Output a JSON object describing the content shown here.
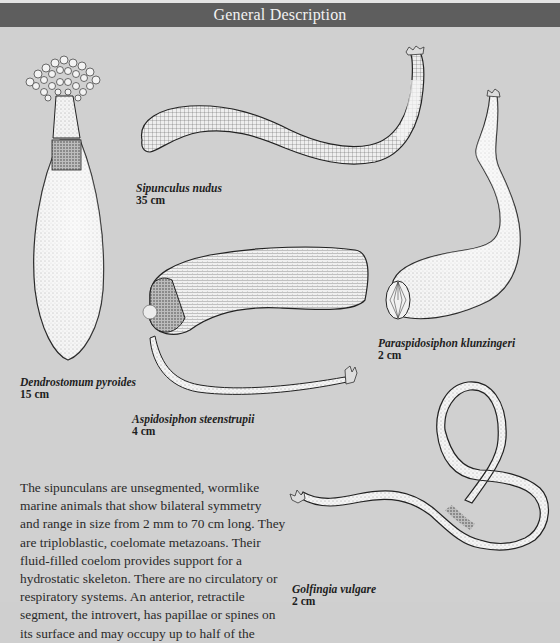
{
  "header": {
    "title": "General Description"
  },
  "specimens": [
    {
      "name": "Dendrostomum pyroides",
      "size": "15 cm",
      "illustration": "dendrostomum-illustration"
    },
    {
      "name": "Sipunculus nudus",
      "size": "35 cm",
      "illustration": "sipunculus-illustration"
    },
    {
      "name": "Paraspidosiphon klunzingeri",
      "size": "2 cm",
      "illustration": "paraspidosiphon-illustration"
    },
    {
      "name": "Aspidosiphon steenstrupii",
      "size": "4 cm",
      "illustration": "aspidosiphon-illustration"
    },
    {
      "name": "Golfingia vulgare",
      "size": "2 cm",
      "illustration": "golfingia-illustration"
    }
  ],
  "body": {
    "lines": [
      "The sipunculans are unsegmented, wormlike",
      "marine animals that show bilateral symmetry",
      "and range in size from 2 mm to 70 cm long. They",
      "are triploblastic, coelomate metazoans. Their",
      "fluid-filled coelom provides support for a",
      "hydrostatic skeleton. There are no circulatory or",
      "respiratory systems. An anterior, retractile",
      "segment, the introvert, has papillae or spines on",
      "its surface and may occupy up to half of the"
    ]
  },
  "colors": {
    "header_bg": "#5e5e5e",
    "header_text": "#f2f2f2",
    "page_bg": "#d0d0d0"
  }
}
